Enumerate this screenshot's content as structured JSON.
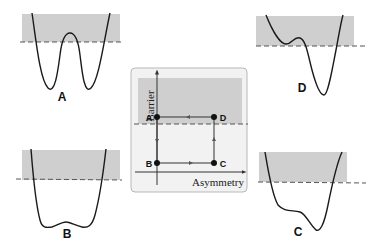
{
  "colors": {
    "shade": "#cfcfcf",
    "inset_bg": "#f2f2f2",
    "inset_border": "#b8b8b8",
    "curve": "#1a1a1a",
    "dash": "#555555"
  },
  "panels": {
    "A": {
      "label": "A",
      "description": "symmetric double well, high barrier"
    },
    "B": {
      "label": "B",
      "description": "symmetric double well, low barrier"
    },
    "C": {
      "label": "C",
      "description": "asymmetric well, low barrier"
    },
    "D": {
      "label": "D",
      "description": "asymmetric double well, high barrier"
    }
  },
  "inset": {
    "y_axis_label": "Barrier",
    "x_axis_label": "Asymmetry",
    "points": [
      {
        "label": "A"
      },
      {
        "label": "B"
      },
      {
        "label": "C"
      },
      {
        "label": "D"
      }
    ],
    "cycle": "A → B → C → D → A"
  }
}
